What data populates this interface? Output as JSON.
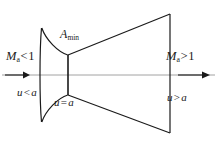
{
  "figure": {
    "background_color": "#ffffff",
    "line_color": "#1a1a1a",
    "centerline_color": "#8c8c8c"
  },
  "labels": {
    "mach_inlet": {
      "symbol": "M",
      "subscript": "a",
      "relation": "<",
      "value": "1",
      "text": "Ma<1"
    },
    "mach_exit": {
      "symbol": "M",
      "subscript": "a",
      "relation": ">",
      "value": "1",
      "text": "Ma>1"
    },
    "throat_area": {
      "symbol": "A",
      "subscript": "min",
      "text": "Amin"
    },
    "velocity_inlet": {
      "symbol": "u",
      "relation": "<",
      "value": "a",
      "text": "u < a"
    },
    "velocity_throat": {
      "symbol": "u",
      "relation": "=",
      "value": "a",
      "text": "u = a"
    },
    "velocity_exit": {
      "symbol": "u",
      "relation": ">",
      "value": "a",
      "text": "u > a"
    }
  },
  "geometry": {
    "inlet_plane_x": 42,
    "throat_plane_x": 68,
    "exit_plane_x": 170,
    "centerline_y": 75,
    "inlet_half_height": 47,
    "throat_half_height": 20,
    "exit_half_height": 60
  },
  "arrows": {
    "inlet_flow_arrow": "flow-arrow-right",
    "exit_flow_arrow": "flow-arrow-right"
  }
}
